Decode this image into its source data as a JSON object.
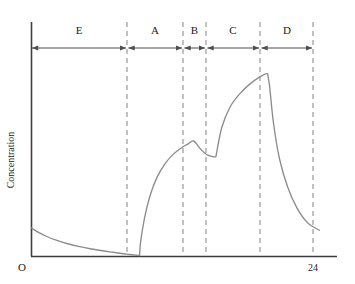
{
  "chart_data": {
    "type": "line",
    "title": "",
    "xlabel": "",
    "ylabel": "Concentration",
    "origin_label": "O",
    "x_tick_labels": [
      "24"
    ],
    "x_tick_values": [
      24
    ],
    "xlim": [
      0,
      26
    ],
    "ylim": [
      0,
      1
    ],
    "grid": false,
    "legend": "none",
    "axis_color": "#404040",
    "curve_color": "#8c8c8c",
    "dashed_color": "#9a9a9a",
    "arrow_color": "#4d4d4d",
    "phase_labels": [
      "E",
      "A",
      "B",
      "C",
      "D"
    ],
    "phase_boundaries_x": [
      0,
      9.2,
      13.8,
      15.7,
      20.1,
      24.5
    ],
    "annotations": [
      {
        "label": "E",
        "span": [
          0,
          9.2
        ],
        "description": "pre-dose exponential decay to baseline"
      },
      {
        "label": "A",
        "span": [
          9.2,
          13.8
        ],
        "description": "steep absorption rise to first peak"
      },
      {
        "label": "B",
        "span": [
          13.8,
          15.7
        ],
        "description": "brief decline to trough"
      },
      {
        "label": "C",
        "span": [
          15.7,
          20.1
        ],
        "description": "second rise to maximum concentration"
      },
      {
        "label": "D",
        "span": [
          20.1,
          24.5
        ],
        "description": "terminal exponential elimination"
      }
    ],
    "series": [
      {
        "name": "Concentration",
        "x": [
          0.0,
          0.6,
          1.3,
          2.1,
          3.0,
          4.0,
          5.1,
          6.3,
          7.5,
          8.4,
          9.1,
          9.2,
          9.25,
          9.6,
          10.1,
          10.7,
          11.4,
          12.1,
          12.8,
          13.3,
          13.8,
          14.4,
          15.0,
          15.7,
          15.75,
          16.2,
          16.9,
          17.7,
          18.5,
          19.3,
          20.1,
          20.25,
          20.6,
          21.1,
          21.8,
          22.6,
          23.5,
          24.5
        ],
        "y": [
          0.152,
          0.128,
          0.106,
          0.086,
          0.068,
          0.052,
          0.038,
          0.026,
          0.015,
          0.008,
          0.003,
          0.002,
          0.06,
          0.2,
          0.33,
          0.43,
          0.505,
          0.555,
          0.59,
          0.608,
          0.625,
          0.58,
          0.548,
          0.54,
          0.56,
          0.7,
          0.81,
          0.88,
          0.93,
          0.968,
          0.99,
          0.93,
          0.72,
          0.53,
          0.375,
          0.26,
          0.18,
          0.14
        ]
      }
    ]
  },
  "figure": {
    "y_axis_title": "Concentration",
    "origin": "O",
    "x_end_tick": "24",
    "phases": [
      {
        "id": "phase-e",
        "label": "E"
      },
      {
        "id": "phase-a",
        "label": "A"
      },
      {
        "id": "phase-b",
        "label": "B"
      },
      {
        "id": "phase-c",
        "label": "C"
      },
      {
        "id": "phase-d",
        "label": "D"
      }
    ]
  }
}
